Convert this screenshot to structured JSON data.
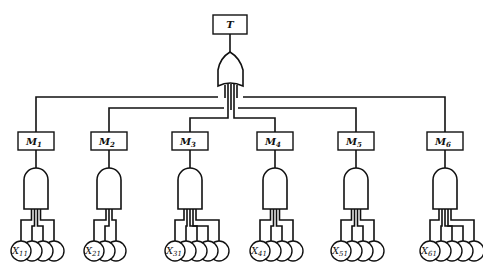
{
  "diagram": {
    "type": "fault-tree",
    "top_event": {
      "label": "T",
      "gate": "OR"
    },
    "modules": [
      {
        "label": "M",
        "sub": "1",
        "gate": "AND",
        "basic_event": "X",
        "basic_sub": "11",
        "inputs": 4
      },
      {
        "label": "M",
        "sub": "2",
        "gate": "AND",
        "basic_event": "X",
        "basic_sub": "21",
        "inputs": 3
      },
      {
        "label": "M",
        "sub": "3",
        "gate": "AND",
        "basic_event": "X",
        "basic_sub": "31",
        "inputs": 5
      },
      {
        "label": "M",
        "sub": "4",
        "gate": "AND",
        "basic_event": "X",
        "basic_sub": "41",
        "inputs": 4
      },
      {
        "label": "M",
        "sub": "5",
        "gate": "AND",
        "basic_event": "X",
        "basic_sub": "51",
        "inputs": 4
      },
      {
        "label": "M",
        "sub": "6",
        "gate": "AND",
        "basic_event": "X",
        "basic_sub": "61",
        "inputs": 5
      }
    ]
  }
}
